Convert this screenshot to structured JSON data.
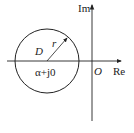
{
  "diagram": {
    "type": "complex-plane-disk",
    "axes": {
      "real_label": "Re",
      "imag_label": "Im",
      "origin_label": "O"
    },
    "disk": {
      "region_label": "D",
      "radius_label": "r",
      "center_label": "α+j0"
    },
    "colors": {
      "stroke": "#222222",
      "background": "#ffffff"
    }
  }
}
